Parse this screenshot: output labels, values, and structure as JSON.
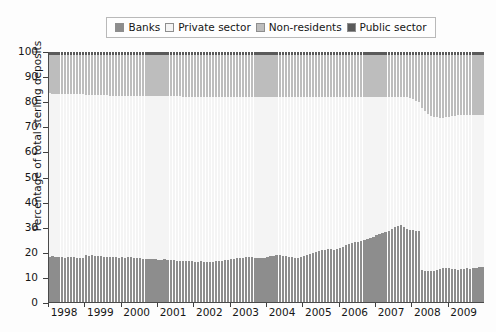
{
  "chart_data": {
    "type": "bar",
    "subtype": "stacked-bar-100-percent",
    "title": "",
    "xlabel": "",
    "ylabel": "Percentage of total sterling deposits",
    "ylim": [
      0,
      100
    ],
    "yticks": [
      0,
      10,
      20,
      30,
      40,
      50,
      60,
      70,
      80,
      90,
      100
    ],
    "xlim": [
      1998.0,
      2010.0
    ],
    "xticks": [
      1998,
      1999,
      2000,
      2001,
      2002,
      2003,
      2004,
      2005,
      2006,
      2007,
      2008,
      2009
    ],
    "xtick_labels": [
      "1998",
      "1999",
      "2000",
      "2001",
      "2002",
      "2003",
      "2004",
      "2005",
      "2006",
      "2007",
      "2008",
      "2009"
    ],
    "grid": false,
    "legend_position": "top-center",
    "legend_entries": [
      "Banks",
      "Private sector",
      "Non-residents",
      "Public sector"
    ],
    "colors": {
      "Banks": "#8d8d8d",
      "Private sector": "#f4f4f4",
      "Non-residents": "#bdbdbd",
      "Public sector": "#5a5a5a",
      "bar_edge": "#9a9a9a",
      "axis": "#3f3f3f",
      "background": "#fdfdfd"
    },
    "x": [
      1998.0,
      1998.08,
      1998.17,
      1998.25,
      1998.33,
      1998.42,
      1998.5,
      1998.58,
      1998.67,
      1998.75,
      1998.83,
      1998.92,
      1999.0,
      1999.08,
      1999.17,
      1999.25,
      1999.33,
      1999.42,
      1999.5,
      1999.58,
      1999.67,
      1999.75,
      1999.83,
      1999.92,
      2000.0,
      2000.08,
      2000.17,
      2000.25,
      2000.33,
      2000.42,
      2000.5,
      2000.58,
      2000.67,
      2000.75,
      2000.83,
      2000.92,
      2001.0,
      2001.08,
      2001.17,
      2001.25,
      2001.33,
      2001.42,
      2001.5,
      2001.58,
      2001.67,
      2001.75,
      2001.83,
      2001.92,
      2002.0,
      2002.08,
      2002.17,
      2002.25,
      2002.33,
      2002.42,
      2002.5,
      2002.58,
      2002.67,
      2002.75,
      2002.83,
      2002.92,
      2003.0,
      2003.08,
      2003.17,
      2003.25,
      2003.33,
      2003.42,
      2003.5,
      2003.58,
      2003.67,
      2003.75,
      2003.83,
      2003.92,
      2004.0,
      2004.08,
      2004.17,
      2004.25,
      2004.33,
      2004.42,
      2004.5,
      2004.58,
      2004.67,
      2004.75,
      2004.83,
      2004.92,
      2005.0,
      2005.08,
      2005.17,
      2005.25,
      2005.33,
      2005.42,
      2005.5,
      2005.58,
      2005.67,
      2005.75,
      2005.83,
      2005.92,
      2006.0,
      2006.08,
      2006.17,
      2006.25,
      2006.33,
      2006.42,
      2006.5,
      2006.58,
      2006.67,
      2006.75,
      2006.83,
      2006.92,
      2007.0,
      2007.08,
      2007.17,
      2007.25,
      2007.33,
      2007.42,
      2007.5,
      2007.58,
      2007.67,
      2007.75,
      2007.83,
      2007.92,
      2008.0,
      2008.08,
      2008.17,
      2008.25,
      2008.33,
      2008.42,
      2008.5,
      2008.58,
      2008.67,
      2008.75,
      2008.83,
      2008.92,
      2009.0,
      2009.08,
      2009.17,
      2009.25,
      2009.33,
      2009.42,
      2009.5,
      2009.58,
      2009.67,
      2009.75,
      2009.83,
      2009.92
    ],
    "series": [
      {
        "name": "Banks",
        "stack_order": 0,
        "color": "#8d8d8d",
        "values": [
          18.5,
          18.6,
          18.4,
          18.3,
          18.2,
          18.1,
          18.4,
          18.3,
          18.2,
          18.0,
          17.9,
          17.8,
          19.0,
          18.9,
          19.0,
          18.8,
          18.7,
          18.6,
          18.5,
          18.4,
          18.4,
          18.3,
          18.2,
          18.1,
          18.2,
          18.1,
          18.3,
          18.2,
          18.0,
          17.9,
          17.8,
          17.6,
          17.7,
          17.6,
          17.5,
          17.4,
          17.3,
          17.2,
          17.4,
          17.3,
          17.1,
          17.0,
          16.9,
          16.8,
          16.9,
          16.8,
          16.7,
          16.6,
          16.5,
          16.4,
          16.6,
          16.5,
          16.4,
          16.3,
          16.5,
          16.6,
          16.8,
          16.9,
          17.0,
          17.1,
          17.4,
          17.6,
          17.8,
          18.0,
          18.1,
          18.3,
          18.4,
          18.2,
          18.0,
          17.9,
          18.0,
          18.1,
          18.4,
          18.6,
          18.9,
          19.1,
          19.0,
          18.8,
          18.6,
          18.4,
          18.2,
          18.1,
          18.0,
          18.2,
          18.6,
          19.0,
          19.4,
          19.8,
          20.2,
          20.6,
          21.0,
          21.3,
          21.6,
          21.4,
          21.2,
          21.5,
          22.0,
          22.5,
          23.0,
          23.4,
          23.8,
          24.2,
          24.5,
          24.8,
          25.2,
          25.6,
          26.0,
          26.5,
          27.0,
          27.4,
          27.8,
          28.2,
          28.8,
          29.5,
          30.2,
          30.8,
          31.0,
          30.4,
          29.6,
          29.2,
          29.0,
          28.8,
          28.5,
          13.0,
          12.8,
          12.6,
          12.7,
          12.9,
          13.2,
          13.5,
          13.8,
          14.0,
          13.8,
          13.6,
          13.4,
          13.2,
          13.4,
          13.7,
          13.9,
          13.6,
          13.8,
          14.1,
          14.3,
          14.5
        ]
      },
      {
        "name": "Private sector",
        "stack_order": 1,
        "color": "#f4f4f4",
        "values": [
          65.0,
          64.7,
          64.8,
          64.9,
          65.0,
          65.1,
          64.7,
          64.8,
          64.9,
          65.1,
          65.2,
          65.3,
          63.9,
          63.9,
          63.8,
          63.9,
          64.0,
          64.1,
          64.2,
          64.3,
          64.2,
          64.3,
          64.4,
          64.5,
          64.4,
          64.5,
          64.2,
          64.3,
          64.5,
          64.6,
          64.7,
          64.9,
          64.7,
          64.8,
          64.9,
          65.0,
          65.1,
          65.2,
          65.0,
          65.0,
          65.2,
          65.3,
          65.4,
          65.5,
          65.3,
          65.4,
          65.5,
          65.6,
          65.7,
          65.8,
          65.5,
          65.6,
          65.7,
          65.8,
          65.5,
          65.4,
          65.2,
          65.1,
          65.0,
          64.9,
          64.6,
          64.4,
          64.1,
          63.9,
          63.8,
          63.6,
          63.5,
          63.7,
          63.9,
          64.0,
          63.9,
          63.8,
          63.5,
          63.3,
          63.0,
          62.8,
          62.9,
          63.1,
          63.3,
          63.5,
          63.7,
          63.8,
          63.9,
          63.7,
          63.3,
          62.9,
          62.5,
          62.1,
          61.7,
          61.3,
          60.9,
          60.6,
          60.3,
          60.5,
          60.7,
          60.4,
          59.9,
          59.4,
          58.9,
          58.5,
          58.1,
          57.7,
          57.4,
          57.1,
          56.7,
          56.3,
          55.9,
          55.4,
          55.0,
          54.6,
          54.2,
          53.8,
          53.2,
          52.5,
          51.8,
          51.2,
          51.0,
          51.6,
          52.4,
          52.6,
          52.4,
          51.8,
          51.4,
          64.5,
          63.8,
          62.9,
          62.0,
          61.4,
          60.8,
          60.4,
          60.1,
          60.2,
          60.5,
          60.8,
          61.2,
          61.6,
          61.5,
          61.2,
          61.0,
          61.4,
          61.2,
          61.0,
          60.8,
          60.6
        ]
      },
      {
        "name": "Non-residents",
        "stack_order": 2,
        "color": "#bdbdbd",
        "values": [
          15.5,
          15.7,
          15.8,
          15.8,
          15.8,
          15.8,
          15.9,
          15.9,
          15.9,
          15.9,
          15.9,
          15.9,
          16.1,
          16.2,
          16.2,
          16.3,
          16.3,
          16.3,
          16.3,
          16.3,
          16.4,
          16.4,
          16.4,
          16.4,
          16.4,
          16.4,
          16.5,
          16.5,
          16.5,
          16.5,
          16.5,
          16.5,
          16.6,
          16.6,
          16.6,
          16.6,
          16.6,
          16.6,
          16.6,
          16.7,
          16.7,
          16.7,
          16.7,
          16.7,
          16.8,
          16.8,
          16.8,
          16.8,
          16.8,
          16.8,
          16.9,
          16.9,
          16.9,
          16.9,
          17.0,
          17.0,
          17.0,
          17.0,
          17.0,
          17.0,
          17.0,
          17.0,
          17.1,
          17.1,
          17.1,
          17.1,
          17.1,
          17.1,
          17.1,
          17.1,
          17.1,
          17.1,
          17.1,
          17.1,
          17.1,
          17.1,
          17.1,
          17.1,
          17.1,
          17.1,
          17.1,
          17.1,
          17.1,
          17.1,
          17.1,
          17.1,
          17.1,
          17.1,
          17.1,
          17.1,
          17.1,
          17.1,
          17.1,
          17.1,
          17.1,
          17.1,
          17.1,
          17.1,
          17.1,
          17.1,
          17.1,
          17.1,
          17.1,
          17.1,
          17.1,
          17.1,
          17.1,
          17.1,
          17.0,
          17.0,
          17.0,
          17.0,
          17.0,
          17.0,
          17.0,
          17.0,
          17.0,
          17.0,
          17.0,
          17.2,
          17.6,
          18.4,
          19.1,
          21.5,
          22.4,
          23.5,
          24.3,
          24.7,
          25.0,
          25.1,
          25.1,
          24.8,
          24.7,
          24.6,
          24.4,
          24.2,
          24.1,
          24.1,
          24.1,
          24.0,
          24.0,
          23.9,
          23.9,
          23.9
        ]
      },
      {
        "name": "Public sector",
        "stack_order": 3,
        "color": "#5a5a5a",
        "values": [
          1.0,
          1.0,
          1.0,
          1.0,
          1.0,
          1.0,
          1.0,
          1.0,
          1.0,
          1.0,
          1.0,
          1.0,
          1.0,
          1.0,
          1.0,
          1.0,
          1.0,
          1.0,
          1.0,
          1.0,
          1.0,
          1.0,
          1.0,
          1.0,
          1.0,
          1.0,
          1.0,
          1.0,
          1.0,
          1.0,
          1.0,
          1.0,
          1.0,
          1.0,
          1.0,
          1.0,
          1.0,
          1.0,
          1.0,
          1.0,
          1.0,
          1.0,
          1.0,
          1.0,
          1.0,
          1.0,
          1.0,
          1.0,
          1.0,
          1.0,
          1.0,
          1.0,
          1.0,
          1.0,
          1.0,
          1.0,
          1.0,
          1.0,
          1.0,
          1.0,
          1.0,
          1.0,
          1.0,
          1.0,
          1.0,
          1.0,
          1.0,
          1.0,
          1.0,
          1.0,
          1.0,
          1.0,
          1.0,
          1.0,
          1.0,
          1.0,
          1.0,
          1.0,
          1.0,
          1.0,
          1.0,
          1.0,
          1.0,
          1.0,
          1.0,
          1.0,
          1.0,
          1.0,
          1.0,
          1.0,
          1.0,
          1.0,
          1.0,
          1.0,
          1.0,
          1.0,
          1.0,
          1.0,
          1.0,
          1.0,
          1.0,
          1.0,
          1.0,
          1.0,
          1.0,
          1.0,
          1.0,
          1.0,
          1.0,
          1.0,
          1.0,
          1.0,
          1.0,
          1.0,
          1.0,
          1.0,
          1.0,
          1.0,
          1.0,
          1.0,
          1.0,
          1.0,
          1.0,
          1.0,
          1.0,
          1.0,
          1.0,
          1.0,
          1.0,
          1.0,
          1.0,
          1.0,
          1.0,
          1.0,
          1.0,
          1.0,
          1.0,
          1.0,
          1.0,
          1.0,
          1.0,
          1.0,
          1.0,
          1.0
        ]
      }
    ]
  },
  "legend": {
    "items": [
      {
        "label": "Banks",
        "color": "#8d8d8d"
      },
      {
        "label": "Private sector",
        "color": "#f4f4f4"
      },
      {
        "label": "Non-residents",
        "color": "#bdbdbd"
      },
      {
        "label": "Public sector",
        "color": "#5a5a5a"
      }
    ]
  },
  "axes": {
    "ylabel": "Percentage of total sterling deposits",
    "ytick_labels": [
      "0",
      "10",
      "20",
      "30",
      "40",
      "50",
      "60",
      "70",
      "80",
      "90",
      "100"
    ],
    "xtick_labels": [
      "1998",
      "1999",
      "2000",
      "2001",
      "2002",
      "2003",
      "2004",
      "2005",
      "2006",
      "2007",
      "2008",
      "2009"
    ]
  }
}
